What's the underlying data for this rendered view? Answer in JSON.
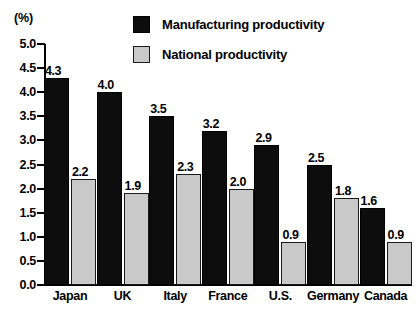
{
  "chart_data": {
    "type": "bar",
    "title": "",
    "subtitle": "",
    "xlabel": "",
    "ylabel": "(%)",
    "unit_label": "(%)",
    "ylim": [
      0.0,
      5.0
    ],
    "ytick_step": 0.5,
    "grid": false,
    "legend_position": "top-center",
    "categories": [
      "Japan",
      "UK",
      "Italy",
      "France",
      "U.S.",
      "Germany",
      "Canada"
    ],
    "yticks": [
      "0.0",
      "0.5",
      "1.0",
      "1.5",
      "2.0",
      "2.5",
      "3.0",
      "3.5",
      "4.0",
      "4.5",
      "5.0"
    ],
    "ytick_values": [
      0.0,
      0.5,
      1.0,
      1.5,
      2.0,
      2.5,
      3.0,
      3.5,
      4.0,
      4.5,
      5.0
    ],
    "series": [
      {
        "name": "Manufacturing productivity",
        "color": "#0d0d0d",
        "values": [
          4.3,
          4.0,
          3.5,
          3.2,
          2.9,
          2.5,
          1.6
        ],
        "labels": [
          "4.3",
          "4.0",
          "3.5",
          "3.2",
          "2.9",
          "2.5",
          "1.6"
        ]
      },
      {
        "name": "National productivity",
        "color": "#c9c9c9",
        "values": [
          2.2,
          1.9,
          2.3,
          2.0,
          0.9,
          1.8,
          0.9
        ],
        "labels": [
          "2.2",
          "1.9",
          "2.3",
          "2.0",
          "0.9",
          "1.8",
          "0.9"
        ]
      }
    ]
  },
  "legend": {
    "items": [
      {
        "label": "Manufacturing productivity",
        "swatch": "manufacturing"
      },
      {
        "label": "National productivity",
        "swatch": "national"
      }
    ]
  }
}
